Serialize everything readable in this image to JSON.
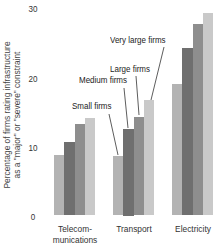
{
  "chart_data": {
    "type": "bar",
    "title": "",
    "xlabel": "",
    "ylabel": "Percentage of firms rating infrastructure as a \"major\" or \"severe\" constraint",
    "ylabel_lines": [
      "Percentage of firms rating infrastructure",
      "as a \"major\" or \"severe\" constraint"
    ],
    "ylim": [
      0,
      30
    ],
    "yticks": [
      0,
      10,
      20,
      30
    ],
    "grid": false,
    "categories": [
      "Telecom-munications",
      "Transport",
      "Electricity"
    ],
    "category_lines": [
      [
        "Telecom-",
        "munications"
      ],
      [
        "Transport"
      ],
      [
        "Electricity"
      ]
    ],
    "series": [
      {
        "name": "Small firms",
        "values": [
          8.8,
          8.6,
          19.1
        ],
        "color": "#b3b3b3"
      },
      {
        "name": "Medium firms",
        "values": [
          10.6,
          12.5,
          24.3
        ],
        "color": "#6f6f6f"
      },
      {
        "name": "Large firms",
        "values": [
          13.3,
          14.3,
          27.7
        ],
        "color": "#8e8e8e"
      },
      {
        "name": "Very large firms",
        "values": [
          14.1,
          16.7,
          29.3
        ],
        "color": "#c9c9c9"
      }
    ],
    "legend": "annotations with leader lines on Transport group"
  }
}
